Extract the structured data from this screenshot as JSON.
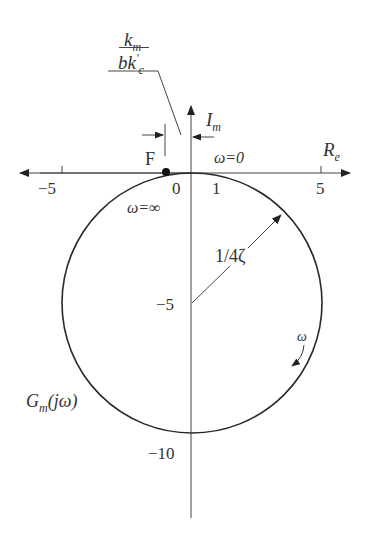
{
  "figure": {
    "type": "nyquist-plot",
    "axes": {
      "real_label": "R",
      "real_sub": "e",
      "imag_label": "I",
      "imag_sub": "m"
    },
    "ticks": {
      "x_neg5": "−5",
      "x_0": "0",
      "x_1": "1",
      "x_5": "5",
      "y_neg5": "−5",
      "y_neg10": "−10"
    },
    "annotations": {
      "point_label": "F",
      "omega_inf": "ω=∞",
      "omega_zero": "ω=0",
      "radius_label": "1/4ζ",
      "direction_label": "ω",
      "curve_label_main": "G",
      "curve_label_sub": "m",
      "curve_label_arg": "(jω)",
      "fraction_num_main": "k",
      "fraction_num_sub": "m",
      "fraction_den_main": "bk",
      "fraction_den_prime": "′",
      "fraction_den_sub": "c"
    },
    "colors": {
      "stroke": "#2a2a2a",
      "axis": "#444444",
      "text": "#333333"
    }
  }
}
